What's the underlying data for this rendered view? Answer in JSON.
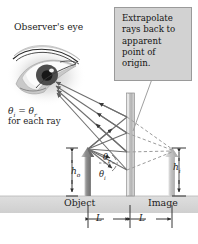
{
  "figure": {
    "background_color": "#ffffff"
  },
  "labels": {
    "observer_eye": "Observer's eye",
    "theta_equality": "θ",
    "theta_equality_sub_i": "i",
    "theta_equality_eq": " = θ",
    "theta_equality_sub_r": "r",
    "for_each_ray": "for each ray",
    "h_object": "h",
    "h_object_sub": "o",
    "h_image": "h",
    "h_image_sub": "i",
    "object": "Object",
    "image": "Image",
    "theta_r": "θ",
    "theta_r_sub": "r",
    "theta_i": "θ",
    "theta_i_sub": "i",
    "distance_left": "L",
    "distance_right": "L"
  },
  "callout": {
    "text": "Extrapolate rays back to apparent point of origin.",
    "box_color": "#d2d2d2",
    "border_color": "#9a9a9a"
  },
  "colors": {
    "ground": "#d8d8d8",
    "mirror": "#b9b9b9",
    "object_arrow": "#8f8f8f",
    "image_arrow": "#c4c4c4",
    "ray": "#6e6e6e",
    "dashed_ray": "#9b9b9b",
    "text": "#1c1c1c"
  },
  "geometry": {
    "mirror_x": 130,
    "object_x": 88,
    "image_x": 172,
    "ground_y": 196,
    "object_top_y": 148,
    "image_top_y": 148,
    "L_left": "L",
    "L_right": "L"
  }
}
